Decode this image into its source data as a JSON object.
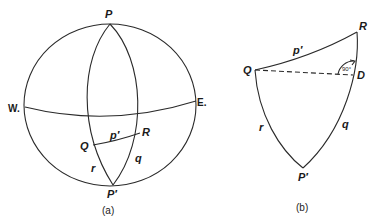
{
  "figure_a": {
    "caption": "(a)",
    "labels": {
      "top_pole": "P",
      "bottom_pole": "P′",
      "west": "W.",
      "east": "E.",
      "point_q": "Q",
      "point_r": "R",
      "arc_p": "p′",
      "arc_q": "q",
      "arc_r": "r"
    }
  },
  "figure_b": {
    "caption": "(b)",
    "labels": {
      "point_r": "R",
      "point_q": "Q",
      "point_d": "D",
      "bottom_pole": "P′",
      "arc_p": "p′",
      "arc_q": "q",
      "arc_r": "r",
      "angle": "90°"
    }
  },
  "colors": {
    "line": "#2a2a2a",
    "text": "#1a1a1a",
    "background": "#ffffff"
  }
}
